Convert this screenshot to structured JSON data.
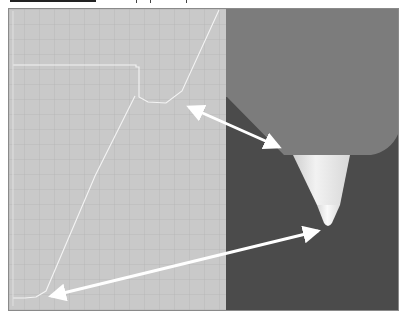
{
  "figure": {
    "left_panel": {
      "type": "grid-with-path-trace",
      "background": "#c9c9c9",
      "grid_color": "#b7b7b7",
      "trace_color": "#f2f2f2"
    },
    "right_panel": {
      "type": "nozzle-photo",
      "background": "#4a4a4a",
      "body_color": "#7b7b7b",
      "cone_color": "#e6e6e6"
    },
    "arrows": [
      {
        "name": "upper-arrow",
        "from": [
          183,
          104
        ],
        "to": [
          283,
          148
        ],
        "double_headed": true
      },
      {
        "name": "lower-arrow",
        "from": [
          44,
          297
        ],
        "to": [
          323,
          228
        ],
        "double_headed": true
      }
    ]
  }
}
